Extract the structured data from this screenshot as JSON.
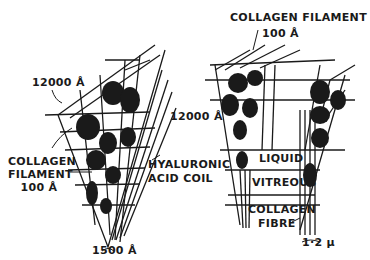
{
  "diagram": {
    "left_cone": {
      "labels": {
        "top_size": "12000 Å",
        "filament_line1": "COLLAGEN",
        "filament_line2": "FILAMENT",
        "filament_line3": "100 Å",
        "coil_line1": "HYALURONIC",
        "coil_line2": "ACID COIL",
        "bottom_size": "1500 Å"
      }
    },
    "right_cone": {
      "labels": {
        "filament_line1": "COLLAGEN FILAMENT",
        "filament_line2": "100 Å",
        "side_size": "12000 Å",
        "liquid": "LIQUID",
        "vitreous": "VITREOUS",
        "fibre_line1": "COLLAGEN",
        "fibre_line2": "FIBRE",
        "bottom_size": "1·2 µ"
      }
    },
    "colors": {
      "ink": "#1a1a1a",
      "background": "#ffffff"
    }
  }
}
